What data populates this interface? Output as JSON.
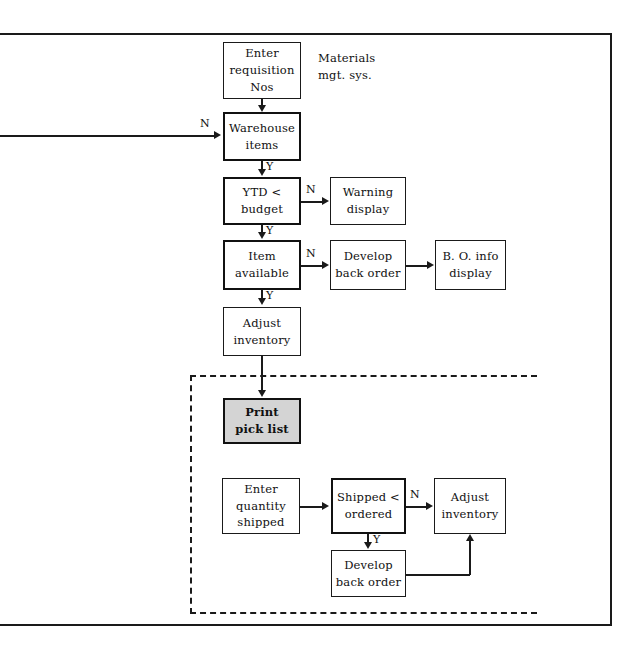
{
  "diagram": {
    "title_label": "Materials\nmgt. sys.",
    "nodes": {
      "enter_requisition": "Enter\nrequisition\nNos",
      "warehouse_items": "Warehouse\nitems",
      "ytd_budget": "YTD <\nbudget",
      "warning_display": "Warning\ndisplay",
      "item_available": "Item\navailable",
      "develop_back_order_1": "Develop\nback order",
      "bo_info_display": "B. O. info\ndisplay",
      "adjust_inventory_1": "Adjust\ninventory",
      "print_pick_list": "Print\npick list",
      "enter_quantity_shipped": "Enter\nquantity\nshipped",
      "shipped_ordered": "Shipped <\nordered",
      "adjust_inventory_2": "Adjust\ninventory",
      "develop_back_order_2": "Develop\nback order"
    },
    "branch_labels": {
      "warehouse_no": "N",
      "warehouse_yes": "Y",
      "ytd_no": "N",
      "ytd_yes": "Y",
      "item_no": "N",
      "item_yes": "Y",
      "shipped_no": "N",
      "shipped_yes": "Y"
    },
    "colors": {
      "stroke": "#1a1a1a",
      "shaded_fill": "#d4d4d4",
      "background": "#ffffff"
    }
  }
}
